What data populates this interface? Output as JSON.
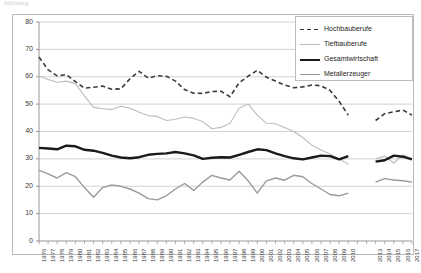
{
  "faint_header": "Abbildung",
  "legend": {
    "position": "top-right",
    "items": [
      {
        "label": "Hochbauberufe",
        "style": "dashed",
        "color": "#3b3b3b",
        "width": 1.6
      },
      {
        "label": "Tiefbauberufe",
        "style": "solid",
        "color": "#bdbdbd",
        "width": 1.1
      },
      {
        "label": "Gesamtwirtschaft",
        "style": "solid",
        "color": "#1a1a1a",
        "width": 2.4
      },
      {
        "label": "Metallerzeuger",
        "style": "solid",
        "color": "#9a9a9a",
        "width": 1.4
      }
    ]
  },
  "chart_data": {
    "type": "line",
    "title": "",
    "xlabel": "",
    "ylabel": "",
    "ylim": [
      0,
      80
    ],
    "yticks": [
      0,
      10,
      20,
      30,
      40,
      50,
      60,
      70,
      80
    ],
    "grid": true,
    "grid_axis": "y",
    "legend_position": "top-right",
    "categories": [
      "1976",
      "1977",
      "1978",
      "1979",
      "1980",
      "1981",
      "1982",
      "1983",
      "1984",
      "1985",
      "1986",
      "1987",
      "1988",
      "1989",
      "1990",
      "1991",
      "1992",
      "1993",
      "1994",
      "1995",
      "1996",
      "1997",
      "1998",
      "1999",
      "2000",
      "2001",
      "2002",
      "2003",
      "2004",
      "2005",
      "2006",
      "2007",
      "2008",
      "2009",
      "2010",
      "2011",
      "2012",
      "2013",
      "2014",
      "2015",
      "2016",
      "2017"
    ],
    "xtick_labels": [
      "1976",
      "1977",
      "1978",
      "1979",
      "1980",
      "1981",
      "1982",
      "1983",
      "1984",
      "1985",
      "1986",
      "1987",
      "1988",
      "1989",
      "1990",
      "1991",
      "1992",
      "1993",
      "1994",
      "1995",
      "1996",
      "1997",
      "1998",
      "1999",
      "2000",
      "2001",
      "2002",
      "2003",
      "2004",
      "2005",
      "2006",
      "2007",
      "2008",
      "2009",
      "2010",
      "",
      "",
      "2013",
      "2014",
      "2015",
      "2016",
      "2017"
    ],
    "gap_years": [
      "2011",
      "2012"
    ],
    "series": [
      {
        "name": "Hochbauberufe",
        "style": "dashed",
        "color": "#3b3b3b",
        "width": 1.6,
        "values": [
          67.2,
          62.5,
          60.3,
          60.8,
          58.2,
          55.8,
          56.2,
          56.6,
          55.4,
          55.6,
          59.3,
          62.0,
          59.5,
          60.4,
          60.2,
          58.4,
          55.3,
          54.0,
          53.9,
          54.6,
          54.7,
          52.7,
          57.8,
          60.2,
          62.4,
          59.8,
          58.4,
          57.0,
          56.0,
          56.3,
          57.0,
          56.7,
          55.0,
          51.0,
          46.0,
          null,
          null,
          44.0,
          46.5,
          47.2,
          47.8,
          46.0
        ]
      },
      {
        "name": "Tiefbauberufe",
        "style": "solid",
        "color": "#bdbdbd",
        "width": 1.1,
        "values": [
          60.3,
          59.0,
          58.0,
          58.4,
          57.5,
          53.0,
          48.8,
          48.3,
          48.0,
          49.2,
          48.5,
          47.0,
          45.8,
          45.5,
          44.0,
          44.5,
          45.3,
          44.8,
          43.6,
          41.0,
          41.5,
          43.0,
          48.5,
          50.0,
          46.0,
          43.0,
          42.8,
          41.5,
          40.0,
          37.8,
          35.0,
          33.2,
          31.8,
          30.0,
          28.0,
          null,
          null,
          30.0,
          31.0,
          28.5,
          31.5,
          30.0
        ]
      },
      {
        "name": "Gesamtwirtschaft",
        "style": "solid",
        "color": "#1a1a1a",
        "width": 2.4,
        "values": [
          34.0,
          33.8,
          33.5,
          34.8,
          34.6,
          33.3,
          33.0,
          32.2,
          31.2,
          30.5,
          30.2,
          30.6,
          31.5,
          31.8,
          32.0,
          32.5,
          32.0,
          31.3,
          30.0,
          30.4,
          30.6,
          30.5,
          31.5,
          32.5,
          33.5,
          33.2,
          32.0,
          31.0,
          30.2,
          29.8,
          30.5,
          31.2,
          31.0,
          29.8,
          31.0,
          null,
          null,
          29.0,
          29.5,
          31.2,
          30.8,
          29.8
        ]
      },
      {
        "name": "Metallerzeuger",
        "style": "solid",
        "color": "#9a9a9a",
        "width": 1.4,
        "values": [
          25.8,
          24.5,
          23.0,
          25.0,
          23.5,
          19.5,
          16.0,
          19.5,
          20.5,
          20.0,
          19.0,
          17.5,
          15.5,
          15.0,
          16.5,
          19.0,
          21.0,
          18.5,
          21.5,
          24.0,
          23.0,
          22.3,
          25.5,
          22.0,
          17.5,
          22.0,
          23.0,
          22.2,
          24.0,
          23.5,
          21.0,
          19.0,
          17.0,
          16.5,
          17.5,
          null,
          null,
          21.5,
          22.8,
          22.3,
          22.0,
          21.5
        ]
      }
    ]
  }
}
